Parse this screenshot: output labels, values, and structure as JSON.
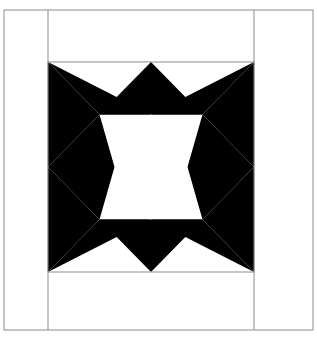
{
  "figure": {
    "kind": "quilt-block-diagram",
    "title": "",
    "canvas": {
      "width": 317,
      "height": 339,
      "background": "#ffffff"
    }
  },
  "colors": {
    "patch_dark": "#000000",
    "patch_light": "#ffffff",
    "frame_line": "#8c8c8c",
    "sashing_line": "#8c8c8c",
    "block_outline": "#8c8c8c",
    "page_background": "#ffffff"
  },
  "layout": {
    "outer_frame": {
      "x": 4,
      "y": 10,
      "width": 309,
      "height": 320,
      "stroke_width": 1
    },
    "column_rules": [
      {
        "name": "left-sashing-rule",
        "x": 48,
        "y1": 10,
        "y2": 330
      },
      {
        "name": "right-sashing-rule",
        "x": 254,
        "y1": 10,
        "y2": 330
      }
    ],
    "block": {
      "name": "star-block",
      "x": 48,
      "y": 62,
      "width": 206,
      "height": 210,
      "grid_rows": 4,
      "grid_cols": 4,
      "cell_width": 51.5,
      "cell_height": 52.5
    }
  },
  "block_geometry": {
    "description": "Eight-point star quilt block on a four by four grid with a light square-on-point at the centre.",
    "center_diamond": {
      "name": "center-square-on-point",
      "fill": "patch_light",
      "points": [
        [
          151,
          114.5
        ],
        [
          187.5,
          167
        ],
        [
          151,
          219.5
        ],
        [
          114.5,
          167
        ]
      ]
    },
    "dark_patches": [
      {
        "name": "star-point-top-left-outer",
        "points": [
          [
            48,
            62
          ],
          [
            151,
            114.5
          ],
          [
            99.5,
            114.5
          ]
        ]
      },
      {
        "name": "star-point-top-left-inner",
        "points": [
          [
            48,
            62
          ],
          [
            99.5,
            114.5
          ],
          [
            48,
            167
          ]
        ]
      },
      {
        "name": "star-point-top-center-left",
        "points": [
          [
            99.5,
            114.5
          ],
          [
            151,
            62
          ],
          [
            151,
            114.5
          ]
        ]
      },
      {
        "name": "star-point-top-center-right",
        "points": [
          [
            151,
            62
          ],
          [
            202.5,
            114.5
          ],
          [
            151,
            114.5
          ]
        ]
      },
      {
        "name": "star-point-top-right-outer",
        "points": [
          [
            254,
            62
          ],
          [
            202.5,
            114.5
          ],
          [
            151,
            114.5
          ]
        ]
      },
      {
        "name": "star-point-top-right-inner",
        "points": [
          [
            254,
            62
          ],
          [
            254,
            167
          ],
          [
            202.5,
            114.5
          ]
        ]
      },
      {
        "name": "star-point-left-upper",
        "points": [
          [
            48,
            167
          ],
          [
            99.5,
            114.5
          ],
          [
            114.5,
            167
          ]
        ]
      },
      {
        "name": "star-point-left-lower",
        "points": [
          [
            48,
            167
          ],
          [
            114.5,
            167
          ],
          [
            99.5,
            219.5
          ]
        ]
      },
      {
        "name": "star-point-right-upper",
        "points": [
          [
            254,
            167
          ],
          [
            187.5,
            167
          ],
          [
            202.5,
            114.5
          ]
        ]
      },
      {
        "name": "star-point-right-lower",
        "points": [
          [
            254,
            167
          ],
          [
            202.5,
            219.5
          ],
          [
            187.5,
            167
          ]
        ]
      },
      {
        "name": "star-point-bottom-left-outer",
        "points": [
          [
            48,
            272
          ],
          [
            48,
            167
          ],
          [
            99.5,
            219.5
          ]
        ]
      },
      {
        "name": "star-point-bottom-left-inner",
        "points": [
          [
            48,
            272
          ],
          [
            99.5,
            219.5
          ],
          [
            151,
            219.5
          ]
        ]
      },
      {
        "name": "star-point-bottom-center-left",
        "points": [
          [
            151,
            272
          ],
          [
            99.5,
            219.5
          ],
          [
            151,
            219.5
          ]
        ]
      },
      {
        "name": "star-point-bottom-center-right",
        "points": [
          [
            151,
            272
          ],
          [
            151,
            219.5
          ],
          [
            202.5,
            219.5
          ]
        ]
      },
      {
        "name": "star-point-bottom-right-inner",
        "points": [
          [
            254,
            272
          ],
          [
            151,
            219.5
          ],
          [
            202.5,
            219.5
          ]
        ]
      },
      {
        "name": "star-point-bottom-right-outer",
        "points": [
          [
            254,
            272
          ],
          [
            202.5,
            219.5
          ],
          [
            254,
            167
          ]
        ]
      }
    ],
    "light_patches": [
      {
        "name": "corner-triangle-top-left",
        "points": [
          [
            48,
            62
          ],
          [
            151,
            62
          ],
          [
            151,
            114.5
          ]
        ]
      },
      {
        "name": "corner-triangle-top-right",
        "points": [
          [
            151,
            62
          ],
          [
            254,
            62
          ],
          [
            151,
            114.5
          ]
        ]
      },
      {
        "name": "corner-triangle-bottom-left",
        "points": [
          [
            48,
            272
          ],
          [
            151,
            219.5
          ],
          [
            151,
            272
          ]
        ]
      },
      {
        "name": "corner-triangle-bottom-right",
        "points": [
          [
            151,
            272
          ],
          [
            151,
            219.5
          ],
          [
            254,
            272
          ]
        ]
      },
      {
        "name": "side-triangle-left-top",
        "points": [
          [
            48,
            62
          ],
          [
            48,
            167
          ],
          [
            99.5,
            114.5
          ]
        ]
      },
      {
        "name": "side-triangle-left-bottom",
        "points": [
          [
            48,
            167
          ],
          [
            48,
            272
          ],
          [
            99.5,
            219.5
          ]
        ]
      },
      {
        "name": "side-triangle-right-top",
        "points": [
          [
            254,
            62
          ],
          [
            202.5,
            114.5
          ],
          [
            254,
            167
          ]
        ]
      },
      {
        "name": "side-triangle-right-bottom",
        "points": [
          [
            254,
            167
          ],
          [
            202.5,
            219.5
          ],
          [
            254,
            272
          ]
        ]
      }
    ]
  }
}
